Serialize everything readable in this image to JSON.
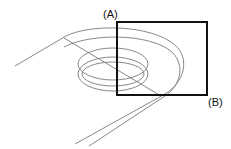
{
  "labels": {
    "a": "(A)",
    "b": "(B)"
  },
  "colors": {
    "line": "#7a7a7a",
    "box": "#111111"
  }
}
